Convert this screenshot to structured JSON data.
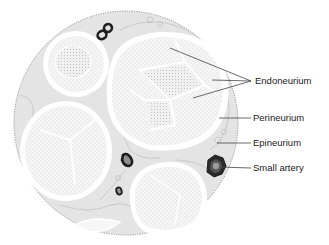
{
  "diagram": {
    "type": "anatomical-cross-section",
    "labels": [
      {
        "id": "endoneurium",
        "text": "Endoneurium",
        "x": 255,
        "y": 76
      },
      {
        "id": "perineurium",
        "text": "Perineurium",
        "x": 253,
        "y": 113
      },
      {
        "id": "epineurium",
        "text": "Epineurium",
        "x": 253,
        "y": 138
      },
      {
        "id": "small-artery",
        "text": "Small artery",
        "x": 253,
        "y": 163
      }
    ],
    "colors": {
      "background": "#ffffff",
      "epineurium_fill": "#e6e6e6",
      "fascicle_fill": "#f4f4f4",
      "perineurium_stroke": "#ffffff",
      "vessel": "#1e1e1e",
      "leader_line": "#444444",
      "text": "#222222"
    }
  }
}
